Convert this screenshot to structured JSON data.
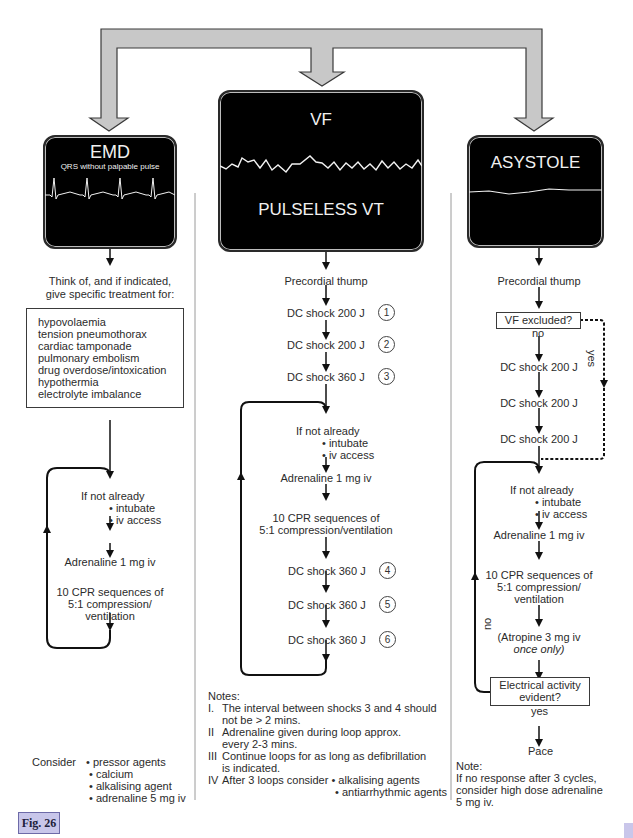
{
  "figure_label": "Fig. 26",
  "monitors": {
    "emd": {
      "title": "EMD",
      "subtitle": "QRS without palpable pulse"
    },
    "vf": {
      "title": "VF",
      "subtitle": "PULSELESS VT"
    },
    "asystole": {
      "title": "ASYSTOLE"
    }
  },
  "emd_column": {
    "think_of": [
      "Think of, and if indicated,",
      "give specific treatment for:"
    ],
    "causes": [
      "hypovolaemia",
      "tension pneumothorax",
      "cardiac tamponade",
      "pulmonary embolism",
      "drug overdose/intoxication",
      "hypothermia",
      "electrolyte imbalance"
    ],
    "if_not_already": "If not already",
    "intubate": "• intubate",
    "iv_access": "• iv access",
    "adrenaline": "Adrenaline 1 mg iv",
    "cpr": [
      "10 CPR sequences of",
      "5:1 compression/",
      "ventilation"
    ],
    "consider_label": "Consider",
    "consider_items": [
      "• pressor agents",
      "• calcium",
      "• alkalising agent",
      "• adrenaline 5 mg iv"
    ]
  },
  "vf_column": {
    "thump": "Precordial thump",
    "shocks_initial": [
      {
        "label": "DC shock 200 J",
        "n": "1"
      },
      {
        "label": "DC shock 200 J",
        "n": "2"
      },
      {
        "label": "DC shock 360 J",
        "n": "3"
      }
    ],
    "if_not_already": "If not already",
    "intubate": "• intubate",
    "iv_access": "• iv access",
    "adrenaline": "Adrenaline 1 mg iv",
    "cpr": [
      "10 CPR sequences of",
      "5:1 compression/ventilation"
    ],
    "shocks_loop": [
      {
        "label": "DC shock 360 J",
        "n": "4"
      },
      {
        "label": "DC shock 360 J",
        "n": "5"
      },
      {
        "label": "DC shock 360 J",
        "n": "6"
      }
    ],
    "notes_title": "Notes:",
    "notes": [
      {
        "num": "I.",
        "lines": [
          "The interval between shocks 3 and 4 should",
          "not be > 2 mins."
        ]
      },
      {
        "num": "II",
        "lines": [
          "Adrenaline given during loop approx.",
          "every 2-3 mins."
        ]
      },
      {
        "num": "III",
        "lines": [
          "Continue loops for as long as defibrillation",
          "is indicated."
        ]
      },
      {
        "num": "IV",
        "lines": [
          "After 3 loops consider • alkalising agents",
          "• antiarrhythmic agents"
        ]
      }
    ]
  },
  "asystole_column": {
    "thump": "Precordial thump",
    "vf_excluded": "VF excluded?",
    "no_label": "no",
    "yes_label": "yes",
    "shocks": [
      "DC shock 200 J",
      "DC shock 200 J",
      "DC shock 200 J"
    ],
    "if_not_already": "If not already",
    "intubate": "• intubate",
    "iv_access": "• iv access",
    "adrenaline": "Adrenaline 1 mg iv",
    "cpr": [
      "10 CPR sequences of",
      "5:1 compression/",
      "ventilation"
    ],
    "atropine": "(Atropine 3 mg iv",
    "atropine_once": "once only)",
    "electrical": [
      "Electrical activity",
      "evident?"
    ],
    "loop_no": "no",
    "elec_yes": "yes",
    "pace": "Pace",
    "note_title": "Note:",
    "note_lines": [
      "If no response after 3 cycles,",
      "consider high dose adrenaline",
      "5 mg iv."
    ]
  },
  "colors": {
    "arrow_fill": "#c8c8c8",
    "monitor_bg": "#000000",
    "figure_tab": "#c8c6ea"
  }
}
